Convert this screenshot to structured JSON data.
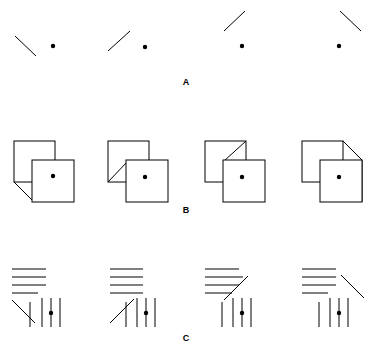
{
  "figure": {
    "title": "",
    "width": 371,
    "height": 357,
    "background_color": "#ffffff",
    "stroke_color": "#000000",
    "dot_color": "#000000",
    "line_width": 1,
    "panels": [
      {
        "id": "panel-a",
        "label": "A",
        "label_x": 186,
        "label_y": 85,
        "description": "Row of four oblique line segments each paired with a reference dot",
        "items": [
          {
            "id": "a1",
            "dot": {
              "x": 53,
              "y": 46,
              "r": 2.2
            },
            "lines": [
              {
                "name": "oblique-line",
                "x1": 15,
                "y1": 36,
                "x2": 36,
                "y2": 56
              }
            ]
          },
          {
            "id": "a2",
            "dot": {
              "x": 145,
              "y": 47,
              "r": 2.2
            },
            "lines": [
              {
                "name": "oblique-line",
                "x1": 108,
                "y1": 51,
                "x2": 130,
                "y2": 31
              }
            ]
          },
          {
            "id": "a3",
            "dot": {
              "x": 242,
              "y": 46,
              "r": 2.2
            },
            "lines": [
              {
                "name": "oblique-line",
                "x1": 224,
                "y1": 31,
                "x2": 245,
                "y2": 11
              }
            ]
          },
          {
            "id": "a4",
            "dot": {
              "x": 339,
              "y": 46,
              "r": 2.2
            },
            "lines": [
              {
                "name": "oblique-line",
                "x1": 340,
                "y1": 11,
                "x2": 361,
                "y2": 31
              }
            ]
          }
        ]
      },
      {
        "id": "panel-b",
        "label": "B",
        "label_x": 186,
        "label_y": 213,
        "description": "Row of four overlapping square pairs with a diagonal corner feature and a centre dot",
        "items": [
          {
            "id": "b1",
            "dot": {
              "x": 53,
              "y": 176,
              "r": 2.2
            },
            "back_square": {
              "x": 14,
              "y": 141,
              "w": 41,
              "h": 41
            },
            "front_square": {
              "x": 32,
              "y": 160,
              "w": 42,
              "h": 42
            },
            "lines": [
              {
                "name": "corner-diagonal",
                "x1": 14,
                "y1": 182,
                "x2": 33,
                "y2": 201
              },
              {
                "name": "corner-diagonal-base",
                "x1": 33,
                "y1": 201,
                "x2": 74,
                "y2": 201
              }
            ]
          },
          {
            "id": "b2",
            "dot": {
              "x": 145,
              "y": 177,
              "r": 2.2
            },
            "back_square": {
              "x": 108,
              "y": 141,
              "w": 41,
              "h": 41
            },
            "front_square": {
              "x": 126,
              "y": 160,
              "w": 42,
              "h": 42
            },
            "lines": [
              {
                "name": "corner-diagonal",
                "x1": 108,
                "y1": 182,
                "x2": 127,
                "y2": 162
              }
            ]
          },
          {
            "id": "b3",
            "dot": {
              "x": 242,
              "y": 177,
              "r": 2.2
            },
            "back_square": {
              "x": 205,
              "y": 141,
              "w": 41,
              "h": 41
            },
            "front_square": {
              "x": 223,
              "y": 160,
              "w": 42,
              "h": 42
            },
            "lines": [
              {
                "name": "corner-diagonal",
                "x1": 246,
                "y1": 141,
                "x2": 224,
                "y2": 161
              }
            ]
          },
          {
            "id": "b4",
            "dot": {
              "x": 339,
              "y": 177,
              "r": 2.2
            },
            "back_square": {
              "x": 302,
              "y": 141,
              "w": 41,
              "h": 41
            },
            "front_square": {
              "x": 320,
              "y": 160,
              "w": 42,
              "h": 42
            },
            "lines": [
              {
                "name": "corner-diagonal",
                "x1": 343,
                "y1": 141,
                "x2": 362,
                "y2": 160
              },
              {
                "name": "corner-diagonal-edge",
                "x1": 362,
                "y1": 160,
                "x2": 362,
                "y2": 202
              }
            ]
          }
        ]
      },
      {
        "id": "panel-c",
        "label": "C",
        "label_x": 186,
        "label_y": 341,
        "description": "Row of four grating figures: stack of horizontal lines, an oblique line, and vertical lines with a dot",
        "items": [
          {
            "id": "c1",
            "dot": {
              "x": 51,
              "y": 313,
              "r": 2.2
            },
            "horizontals": [
              {
                "x1": 12,
                "y1": 269,
                "x2": 46,
                "y2": 269
              },
              {
                "x1": 12,
                "y1": 277,
                "x2": 46,
                "y2": 277
              },
              {
                "x1": 12,
                "y1": 285,
                "x2": 46,
                "y2": 285
              },
              {
                "x1": 12,
                "y1": 293,
                "x2": 38,
                "y2": 293
              }
            ],
            "obliques": [
              {
                "x1": 12,
                "y1": 300,
                "x2": 35,
                "y2": 323
              }
            ],
            "verticals": [
              {
                "x1": 30,
                "y1": 302,
                "x2": 30,
                "y2": 327
              },
              {
                "x1": 42,
                "y1": 298,
                "x2": 42,
                "y2": 327
              },
              {
                "x1": 51,
                "y1": 298,
                "x2": 51,
                "y2": 327
              },
              {
                "x1": 60,
                "y1": 298,
                "x2": 60,
                "y2": 327
              }
            ]
          },
          {
            "id": "c2",
            "dot": {
              "x": 146,
              "y": 313,
              "r": 2.2
            },
            "horizontals": [
              {
                "x1": 110,
                "y1": 269,
                "x2": 143,
                "y2": 269
              },
              {
                "x1": 110,
                "y1": 277,
                "x2": 143,
                "y2": 277
              },
              {
                "x1": 110,
                "y1": 285,
                "x2": 143,
                "y2": 285
              },
              {
                "x1": 110,
                "y1": 293,
                "x2": 143,
                "y2": 293
              }
            ],
            "obliques": [
              {
                "x1": 110,
                "y1": 323,
                "x2": 134,
                "y2": 299
              }
            ],
            "verticals": [
              {
                "x1": 126,
                "y1": 302,
                "x2": 126,
                "y2": 327
              },
              {
                "x1": 137,
                "y1": 298,
                "x2": 137,
                "y2": 327
              },
              {
                "x1": 146,
                "y1": 298,
                "x2": 146,
                "y2": 327
              },
              {
                "x1": 155,
                "y1": 298,
                "x2": 155,
                "y2": 327
              }
            ]
          },
          {
            "id": "c3",
            "dot": {
              "x": 242,
              "y": 313,
              "r": 2.2
            },
            "horizontals": [
              {
                "x1": 205,
                "y1": 269,
                "x2": 239,
                "y2": 269
              },
              {
                "x1": 205,
                "y1": 277,
                "x2": 243,
                "y2": 277
              },
              {
                "x1": 205,
                "y1": 285,
                "x2": 239,
                "y2": 285
              },
              {
                "x1": 205,
                "y1": 293,
                "x2": 232,
                "y2": 293
              }
            ],
            "obliques": [
              {
                "x1": 224,
                "y1": 300,
                "x2": 248,
                "y2": 276
              }
            ],
            "verticals": [
              {
                "x1": 222,
                "y1": 302,
                "x2": 222,
                "y2": 327
              },
              {
                "x1": 233,
                "y1": 298,
                "x2": 233,
                "y2": 327
              },
              {
                "x1": 242,
                "y1": 298,
                "x2": 242,
                "y2": 327
              },
              {
                "x1": 251,
                "y1": 298,
                "x2": 251,
                "y2": 327
              }
            ]
          },
          {
            "id": "c4",
            "dot": {
              "x": 339,
              "y": 313,
              "r": 2.2
            },
            "horizontals": [
              {
                "x1": 302,
                "y1": 269,
                "x2": 336,
                "y2": 269
              },
              {
                "x1": 302,
                "y1": 277,
                "x2": 336,
                "y2": 277
              },
              {
                "x1": 302,
                "y1": 285,
                "x2": 336,
                "y2": 285
              },
              {
                "x1": 302,
                "y1": 293,
                "x2": 328,
                "y2": 293
              }
            ],
            "obliques": [
              {
                "x1": 341,
                "y1": 275,
                "x2": 364,
                "y2": 298
              }
            ],
            "verticals": [
              {
                "x1": 319,
                "y1": 302,
                "x2": 319,
                "y2": 327
              },
              {
                "x1": 330,
                "y1": 298,
                "x2": 330,
                "y2": 327
              },
              {
                "x1": 339,
                "y1": 298,
                "x2": 339,
                "y2": 327
              },
              {
                "x1": 348,
                "y1": 298,
                "x2": 348,
                "y2": 327
              }
            ]
          }
        ]
      }
    ]
  }
}
